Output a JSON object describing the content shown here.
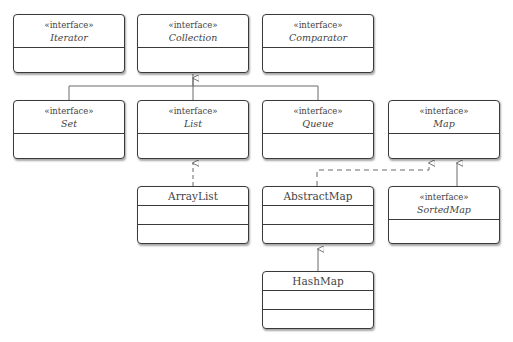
{
  "diagram": {
    "type": "uml-class-diagram",
    "stereotype_label": "«interface»",
    "colors": {
      "border": "#3a3a3a",
      "text": "#444444",
      "line": "#6a6a6a",
      "background": "#ffffff"
    },
    "nodes": [
      {
        "id": "iterator",
        "name": "Iterator",
        "kind": "interface",
        "stereotype": "«interface»"
      },
      {
        "id": "collection",
        "name": "Collection",
        "kind": "interface",
        "stereotype": "«interface»"
      },
      {
        "id": "comparator",
        "name": "Comparator",
        "kind": "interface",
        "stereotype": "«interface»"
      },
      {
        "id": "set",
        "name": "Set",
        "kind": "interface",
        "stereotype": "«interface»"
      },
      {
        "id": "list",
        "name": "List",
        "kind": "interface",
        "stereotype": "«interface»"
      },
      {
        "id": "queue",
        "name": "Queue",
        "kind": "interface",
        "stereotype": "«interface»"
      },
      {
        "id": "map",
        "name": "Map",
        "kind": "interface",
        "stereotype": "«interface»"
      },
      {
        "id": "arraylist",
        "name": "ArrayList",
        "kind": "class"
      },
      {
        "id": "abstractmap",
        "name": "AbstractMap",
        "kind": "class"
      },
      {
        "id": "sortedmap",
        "name": "SortedMap",
        "kind": "interface",
        "stereotype": "«interface»"
      },
      {
        "id": "hashmap",
        "name": "HashMap",
        "kind": "class"
      }
    ],
    "edges": [
      {
        "from": "set",
        "to": "collection",
        "type": "generalization"
      },
      {
        "from": "list",
        "to": "collection",
        "type": "generalization"
      },
      {
        "from": "queue",
        "to": "collection",
        "type": "generalization"
      },
      {
        "from": "arraylist",
        "to": "list",
        "type": "realization"
      },
      {
        "from": "abstractmap",
        "to": "map",
        "type": "realization"
      },
      {
        "from": "sortedmap",
        "to": "map",
        "type": "generalization"
      },
      {
        "from": "hashmap",
        "to": "abstractmap",
        "type": "generalization"
      }
    ]
  }
}
